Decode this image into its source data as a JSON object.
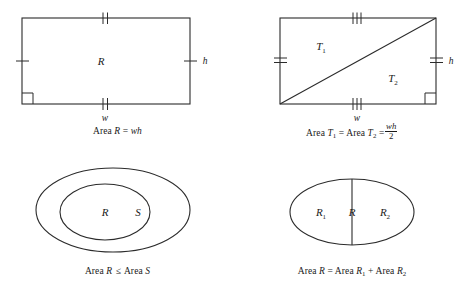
{
  "document": {
    "title": "Area properties of plane figures",
    "figure_count": 4,
    "stroke_color": "#2b2b2b",
    "background_color": "#ffffff",
    "text_color": "#1a1a1a"
  },
  "figures": [
    {
      "id": "rectangle-area",
      "position": "top-left",
      "shape": "rectangle",
      "region_label": "R",
      "width_label": "w",
      "height_label": "h",
      "tick_marks": {
        "top": 2,
        "bottom": 2,
        "left": 1,
        "right": 1
      },
      "right_angle_marker": "bottom-left",
      "caption": {
        "prefix": "Area ",
        "region": "R",
        "relation": "=",
        "expression": "wh",
        "full_text": "Area R = wh"
      }
    },
    {
      "id": "triangle-halves",
      "position": "top-right",
      "shape": "rectangle-with-diagonal",
      "region_labels": [
        "T",
        "T"
      ],
      "region_subscripts": [
        "1",
        "2"
      ],
      "width_label": "w",
      "height_label": "h",
      "tick_marks": {
        "top": 3,
        "bottom": 3,
        "left": 2,
        "right": 2
      },
      "right_angle_marker": "bottom-right",
      "caption": {
        "prefix": "Area ",
        "term1": "T",
        "term1_sub": "1",
        "relation1": "=",
        "term2": "T",
        "term2_sub": "2",
        "relation2": "=",
        "fraction_numerator": "wh",
        "fraction_denominator": "2",
        "full_text": "Area T1 = Area T2 = wh/2"
      }
    },
    {
      "id": "nested-regions",
      "position": "bottom-left",
      "shape": "nested-ellipses",
      "inner_label": "R",
      "outer_label": "S",
      "caption": {
        "prefix": "Area ",
        "term1": "R",
        "relation": "≤",
        "term2": "S",
        "full_text": "Area R ≤ Area S"
      }
    },
    {
      "id": "additive-regions",
      "position": "bottom-right",
      "shape": "ellipse-divided",
      "left_label": "R",
      "left_subscript": "1",
      "whole_label": "R",
      "right_label": "R",
      "right_subscript": "2",
      "divider": "vertical-line",
      "caption": {
        "prefix": "Area ",
        "whole": "R",
        "relation": "=",
        "part1": "R",
        "part1_sub": "1",
        "operator": "+",
        "part2": "R",
        "part2_sub": "2",
        "full_text": "Area R = Area R1 + Area R2"
      }
    }
  ]
}
